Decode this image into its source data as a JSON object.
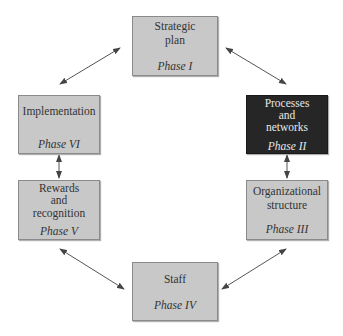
{
  "diagram": {
    "colors": {
      "box_fill": "#c8c8c8",
      "box_border": "#8a8a8a",
      "highlight_fill": "#262626",
      "highlight_text": "#e6e6e6",
      "arrow": "#555555"
    },
    "nodes": [
      {
        "id": "strategic-plan",
        "title": "Strategic\nplan",
        "phase": "Phase I",
        "highlighted": false
      },
      {
        "id": "processes-networks",
        "title": "Processes\nand\nnetworks",
        "phase": "Phase II",
        "highlighted": true
      },
      {
        "id": "organizational-structure",
        "title": "Organizational\nstructure",
        "phase": "Phase III",
        "highlighted": false
      },
      {
        "id": "staff",
        "title": "Staff",
        "phase": "Phase IV",
        "highlighted": false
      },
      {
        "id": "rewards-recognition",
        "title": "Rewards\nand\nrecognition",
        "phase": "Phase V",
        "highlighted": false
      },
      {
        "id": "implementation",
        "title": "Implementation",
        "phase": "Phase VI",
        "highlighted": false
      }
    ],
    "edges": [
      {
        "from": "Phase I",
        "to": "Phase II",
        "direction": "both"
      },
      {
        "from": "Phase II",
        "to": "Phase III",
        "direction": "both"
      },
      {
        "from": "Phase III",
        "to": "Phase IV",
        "direction": "both"
      },
      {
        "from": "Phase IV",
        "to": "Phase V",
        "direction": "both"
      },
      {
        "from": "Phase V",
        "to": "Phase VI",
        "direction": "both"
      },
      {
        "from": "Phase VI",
        "to": "Phase I",
        "direction": "both"
      }
    ]
  }
}
